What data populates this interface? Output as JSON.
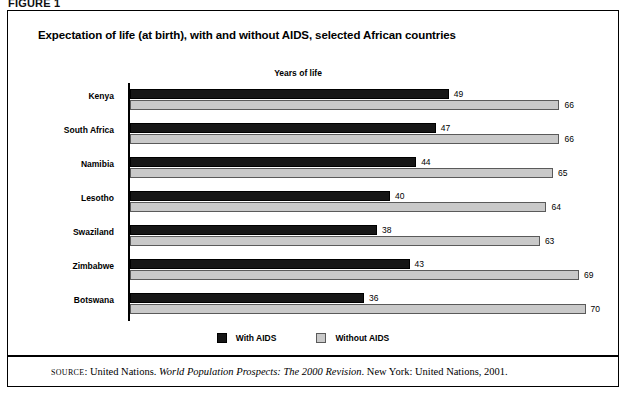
{
  "figure": {
    "label": "FIGURE 1"
  },
  "chart": {
    "title": "Expectation of life (at birth), with and without AIDS, selected African countries",
    "axis_caption": "Years of life",
    "legend": [
      {
        "label": "With AIDS",
        "key": "with_aids",
        "color": "#161616"
      },
      {
        "label": "Without AIDS",
        "key": "without_aids",
        "color": "#c9c9c9"
      }
    ]
  },
  "source": {
    "label": "SOURCE",
    "separator": ": ",
    "publisher_lead": "United Nations. ",
    "work": "World Population Prospects: The 2000 Revision",
    "tail": ". New York: United Nations, 2001."
  },
  "chart_data": {
    "type": "bar",
    "orientation": "horizontal",
    "title": "Expectation of life (at birth), with and without AIDS, selected African countries",
    "xlabel": "Years of life",
    "ylabel": "",
    "xlim": [
      0,
      70
    ],
    "grid": false,
    "legend_position": "bottom",
    "categories": [
      "Kenya",
      "South Africa",
      "Namibia",
      "Lesotho",
      "Swaziland",
      "Zimbabwe",
      "Botswana"
    ],
    "series": [
      {
        "name": "With AIDS",
        "color": "#161616",
        "values": [
          49,
          47,
          44,
          40,
          38,
          43,
          36
        ]
      },
      {
        "name": "Without AIDS",
        "color": "#c9c9c9",
        "values": [
          66,
          66,
          65,
          64,
          63,
          69,
          70
        ]
      }
    ],
    "rows": [
      {
        "country": "Kenya",
        "with_aids": 49,
        "without_aids": 66
      },
      {
        "country": "South Africa",
        "with_aids": 47,
        "without_aids": 66
      },
      {
        "country": "Namibia",
        "with_aids": 44,
        "without_aids": 65
      },
      {
        "country": "Lesotho",
        "with_aids": 40,
        "without_aids": 64
      },
      {
        "country": "Swaziland",
        "with_aids": 38,
        "without_aids": 63
      },
      {
        "country": "Zimbabwe",
        "with_aids": 43,
        "without_aids": 69
      },
      {
        "country": "Botswana",
        "with_aids": 36,
        "without_aids": 70
      }
    ]
  }
}
